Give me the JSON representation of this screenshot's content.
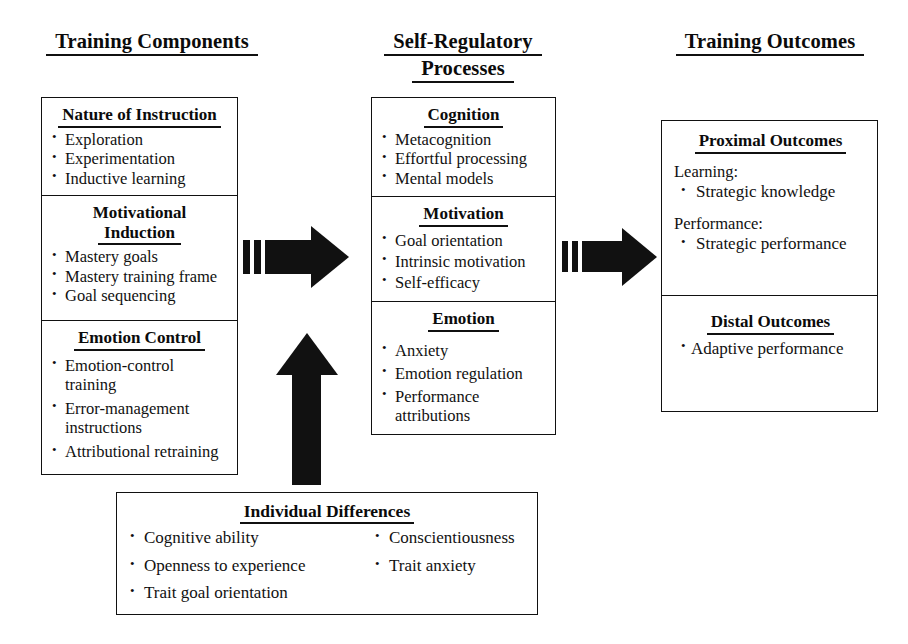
{
  "headers": {
    "left": {
      "line1": "Training Components"
    },
    "center": {
      "line1": "Self-Regulatory",
      "line2": "Processes"
    },
    "right": {
      "line1": "Training Outcomes"
    }
  },
  "training_components": {
    "cells": [
      {
        "title": "Nature of Instruction",
        "items": [
          "Exploration",
          "Experimentation",
          "Inductive learning"
        ]
      },
      {
        "title_line1": "Motivational",
        "title_line2": "Induction",
        "items": [
          "Mastery goals",
          "Mastery training frame",
          "Goal sequencing"
        ]
      },
      {
        "title": "Emotion Control",
        "items": [
          "Emotion-control training",
          "Error-management instructions",
          "Attributional retraining"
        ]
      }
    ]
  },
  "self_regulatory_processes": {
    "cells": [
      {
        "title": "Cognition",
        "items": [
          "Metacognition",
          "Effortful processing",
          "Mental models"
        ]
      },
      {
        "title": "Motivation",
        "items": [
          "Goal orientation",
          "Intrinsic motivation",
          "Self-efficacy"
        ]
      },
      {
        "title": "Emotion",
        "items": [
          "Anxiety",
          "Emotion regulation",
          "Performance attributions"
        ]
      }
    ]
  },
  "training_outcomes": {
    "cells": [
      {
        "title": "Proximal Outcomes",
        "groups": [
          {
            "label": "Learning:",
            "items": [
              "Strategic knowledge"
            ]
          },
          {
            "label": "Performance:",
            "items": [
              "Strategic performance"
            ]
          }
        ]
      },
      {
        "title": "Distal Outcomes",
        "items": [
          "Adaptive performance"
        ]
      }
    ]
  },
  "individual_differences": {
    "title": "Individual Differences",
    "column_left": [
      "Cognitive ability",
      "Openness to experience",
      "Trait goal orientation"
    ],
    "column_right": [
      "Conscientiousness",
      "Trait anxiety"
    ]
  },
  "arrows": {
    "components_to_processes": "arrow-right",
    "processes_to_outcomes": "arrow-right",
    "individual_differences_to_components": "arrow-up"
  },
  "colors": {
    "ink": "#111111",
    "background": "#ffffff"
  }
}
